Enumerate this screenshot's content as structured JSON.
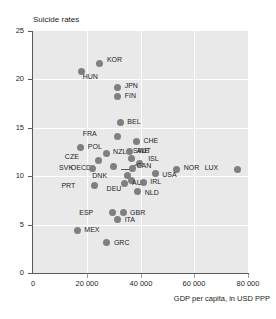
{
  "chart_data": {
    "type": "scatter",
    "title": "Suicide rates",
    "xlabel": "GDP per capita, in USD PPP",
    "ylabel": "",
    "xlim": [
      0,
      80000
    ],
    "ylim": [
      0,
      25
    ],
    "xticks": [
      0,
      20000,
      40000,
      60000,
      80000
    ],
    "xtick_labels": [
      "0",
      "20 000",
      "40 000",
      "60 000",
      "80 000"
    ],
    "yticks": [
      0,
      5,
      10,
      15,
      20,
      25
    ],
    "ytick_labels": [
      "0",
      "5",
      "10",
      "15",
      "20",
      "25"
    ],
    "grid": true,
    "legend": "none",
    "marker_color": "#7f7f7f",
    "panel_color": "#e9e9e9",
    "gridline_color": "#ffffff",
    "axis_color": "#58595b",
    "points": [
      {
        "label": "KOR",
        "x": 24900,
        "y": 21.6,
        "lx": 7,
        "ly": -4
      },
      {
        "label": "HUN",
        "x": 18100,
        "y": 20.8,
        "lx": 1,
        "ly": 5
      },
      {
        "label": "JPN",
        "x": 31500,
        "y": 19.2,
        "lx": 7,
        "ly": -1
      },
      {
        "label": "FIN",
        "x": 31500,
        "y": 18.2,
        "lx": 7,
        "ly": -1
      },
      {
        "label": "BEL",
        "x": 32500,
        "y": 15.5,
        "lx": 7,
        "ly": -1
      },
      {
        "label": "FRA",
        "x": 31500,
        "y": 14.1,
        "lx": -21,
        "ly": -3
      },
      {
        "label": "CHE",
        "x": 38500,
        "y": 13.6,
        "lx": 7,
        "ly": 0
      },
      {
        "label": "POL",
        "x": 17800,
        "y": 13.0,
        "lx": 7,
        "ly": 0
      },
      {
        "label": "AUT",
        "x": 36000,
        "y": 12.6,
        "lx": 7,
        "ly": 0
      },
      {
        "label": "NZL",
        "x": 27200,
        "y": 12.3,
        "lx": 7,
        "ly": -2
      },
      {
        "label": "CZE",
        "x": 24500,
        "y": 11.6,
        "lx": -20,
        "ly": -4
      },
      {
        "label": "SWE",
        "x": 36500,
        "y": 11.8,
        "lx": 2,
        "ly": -8
      },
      {
        "label": "ISL",
        "x": 39500,
        "y": 11.3,
        "lx": 9,
        "ly": -5
      },
      {
        "label": "OECD",
        "x": 29800,
        "y": 11.0,
        "lx": -22,
        "ly": 1
      },
      {
        "label": "SVK",
        "x": 22000,
        "y": 10.8,
        "lx": -19,
        "ly": 0
      },
      {
        "label": "CAN",
        "x": 37000,
        "y": 10.8,
        "lx": 4,
        "ly": -2
      },
      {
        "label": "NOR",
        "x": 53500,
        "y": 10.7,
        "lx": 7,
        "ly": -1
      },
      {
        "label": "LUX",
        "x": 76000,
        "y": 10.7,
        "lx": -19,
        "ly": -1
      },
      {
        "label": "USA",
        "x": 45500,
        "y": 10.3,
        "lx": 7,
        "ly": 2
      },
      {
        "label": "DNK",
        "x": 35000,
        "y": 10.1,
        "lx": -20,
        "ly": 1
      },
      {
        "label": "AUS",
        "x": 36500,
        "y": 9.6,
        "lx": 1,
        "ly": 3
      },
      {
        "label": "DEU",
        "x": 34000,
        "y": 9.2,
        "lx": -3,
        "ly": 5
      },
      {
        "label": "IRL",
        "x": 41000,
        "y": 9.4,
        "lx": 7,
        "ly": 0
      },
      {
        "label": "PRT",
        "x": 22800,
        "y": 9.0,
        "lx": -19,
        "ly": 0
      },
      {
        "label": "NLD",
        "x": 39000,
        "y": 8.4,
        "lx": 7,
        "ly": 1
      },
      {
        "label": "ESP",
        "x": 29500,
        "y": 6.2,
        "lx": -19,
        "ly": 0
      },
      {
        "label": "GBR",
        "x": 33500,
        "y": 6.2,
        "lx": 7,
        "ly": 0
      },
      {
        "label": "ITA",
        "x": 31500,
        "y": 5.5,
        "lx": 7,
        "ly": 0
      },
      {
        "label": "MEX",
        "x": 16500,
        "y": 4.4,
        "lx": 7,
        "ly": 0
      },
      {
        "label": "GRC",
        "x": 27500,
        "y": 3.1,
        "lx": 7,
        "ly": 0
      }
    ],
    "leaders": [
      {
        "from_label": "ISL",
        "x1": 40500,
        "y1": 11.6,
        "x2": 37500,
        "y2": 11.0
      },
      {
        "from_label": "CAN",
        "x1": 36000,
        "y1": 10.6,
        "x2": 32500,
        "y2": 10.6
      }
    ]
  }
}
